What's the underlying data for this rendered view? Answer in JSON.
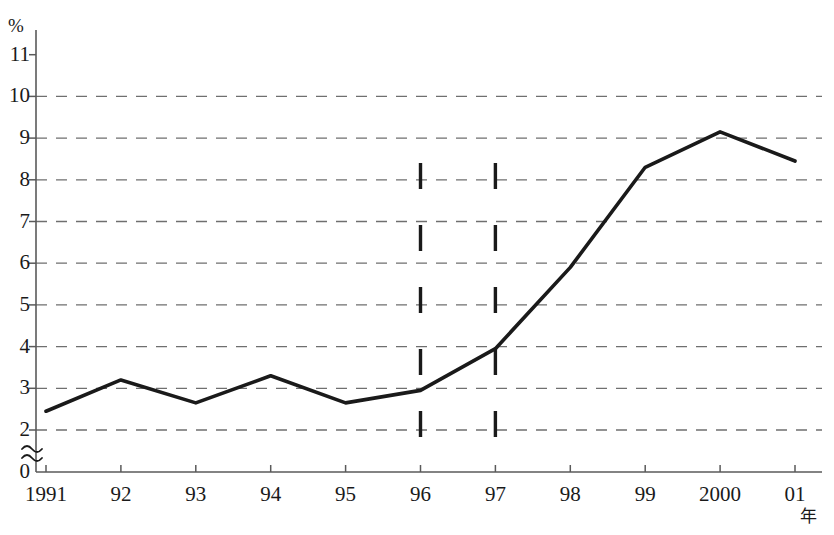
{
  "chart_data": {
    "type": "line",
    "title": "",
    "xlabel": "年",
    "ylabel": "%",
    "ylim": [
      0,
      11.5
    ],
    "y_axis_break": true,
    "y_break_symbol": "≈",
    "grid": true,
    "grid_style": "dashed-horizontal",
    "legend": "none",
    "categories": [
      "1991",
      "92",
      "93",
      "94",
      "95",
      "96",
      "97",
      "98",
      "99",
      "2000",
      "01"
    ],
    "x": [
      1991,
      1992,
      1993,
      1994,
      1995,
      1996,
      1997,
      1998,
      1999,
      2000,
      2001
    ],
    "values": [
      2.45,
      3.2,
      2.65,
      3.3,
      2.65,
      2.95,
      3.95,
      5.9,
      8.3,
      9.15,
      8.45
    ],
    "series": [
      {
        "name": "rate",
        "values": [
          2.45,
          3.2,
          2.65,
          3.3,
          2.65,
          2.95,
          3.95,
          5.9,
          8.3,
          9.15,
          8.45
        ]
      }
    ],
    "y_ticks": [
      0,
      2,
      3,
      4,
      5,
      6,
      7,
      8,
      9,
      10,
      11
    ],
    "y_tick_labels": [
      "0",
      "2",
      "3",
      "4",
      "5",
      "6",
      "7",
      "8",
      "9",
      "10",
      "11"
    ],
    "gridline_values": [
      2,
      3,
      4,
      5,
      6,
      7,
      8,
      9,
      10
    ],
    "annotations": [
      {
        "name": "vertical-marker-96",
        "type": "vertical-dashed-line",
        "x_category": "96",
        "y_from": 1.35,
        "y_to": 8.4
      },
      {
        "name": "vertical-marker-97",
        "type": "vertical-dashed-line",
        "x_category": "97",
        "y_from": 1.35,
        "y_to": 8.4
      }
    ],
    "line_color": "#1a1a1a",
    "grid_color": "#6f6f6f",
    "axis_color": "#5a5a5a",
    "background_color": "#ffffff"
  }
}
